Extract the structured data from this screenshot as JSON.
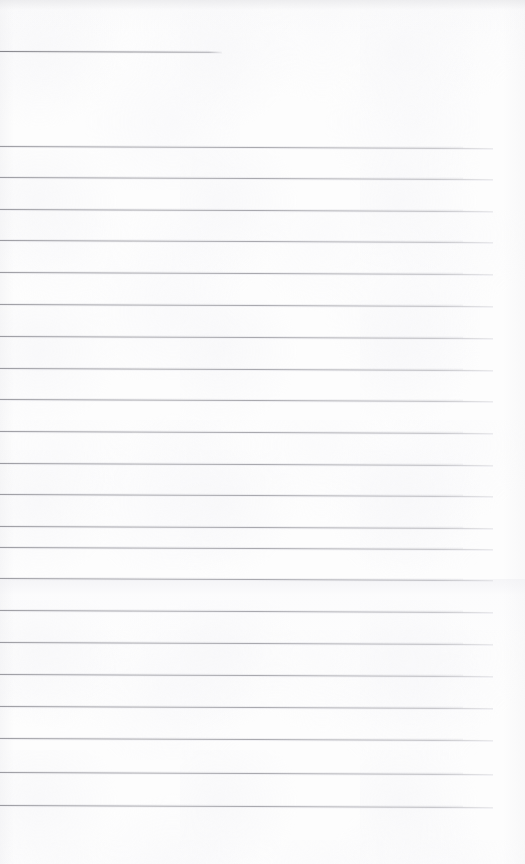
{
  "document": {
    "kind": "scanned-ruled-paper",
    "title": "Blank ruled notebook page",
    "page_width": 525,
    "page_height": 864,
    "paper_color": "#fdfdfd",
    "rule_color": "#9a9aa0",
    "header_rule_color": "#86868c",
    "text_content": "",
    "is_blank": true
  },
  "layout": {
    "left_margin": 0,
    "right_margin": 32,
    "top_margin": 140,
    "bottom_margin": 54,
    "rule_pitch": 31.8,
    "skew_degrees": 0.22
  },
  "header_rule": {
    "y": 51,
    "x_start": 0,
    "x_end": 222,
    "width": 222
  },
  "tone_band": {
    "y": 579,
    "height": 60
  },
  "rules": [
    {
      "y": 146,
      "x_start": 0,
      "x_end": 493
    },
    {
      "y": 177,
      "x_start": 0,
      "x_end": 493
    },
    {
      "y": 209,
      "x_start": 0,
      "x_end": 493
    },
    {
      "y": 240,
      "x_start": 0,
      "x_end": 493
    },
    {
      "y": 272,
      "x_start": 0,
      "x_end": 493
    },
    {
      "y": 304,
      "x_start": 0,
      "x_end": 493
    },
    {
      "y": 336,
      "x_start": 0,
      "x_end": 493
    },
    {
      "y": 368,
      "x_start": 0,
      "x_end": 493
    },
    {
      "y": 399,
      "x_start": 0,
      "x_end": 493
    },
    {
      "y": 431,
      "x_start": 0,
      "x_end": 493
    },
    {
      "y": 463,
      "x_start": 0,
      "x_end": 493
    },
    {
      "y": 494,
      "x_start": 0,
      "x_end": 493
    },
    {
      "y": 526,
      "x_start": 0,
      "x_end": 493
    },
    {
      "y": 547,
      "x_start": 0,
      "x_end": 493
    },
    {
      "y": 578,
      "x_start": 0,
      "x_end": 493
    },
    {
      "y": 610,
      "x_start": 0,
      "x_end": 493
    },
    {
      "y": 642,
      "x_start": 0,
      "x_end": 493
    },
    {
      "y": 674,
      "x_start": 0,
      "x_end": 493
    },
    {
      "y": 706,
      "x_start": 0,
      "x_end": 493
    },
    {
      "y": 738,
      "x_start": 0,
      "x_end": 493
    },
    {
      "y": 772,
      "x_start": 0,
      "x_end": 493
    },
    {
      "y": 805,
      "x_start": 0,
      "x_end": 493
    }
  ]
}
